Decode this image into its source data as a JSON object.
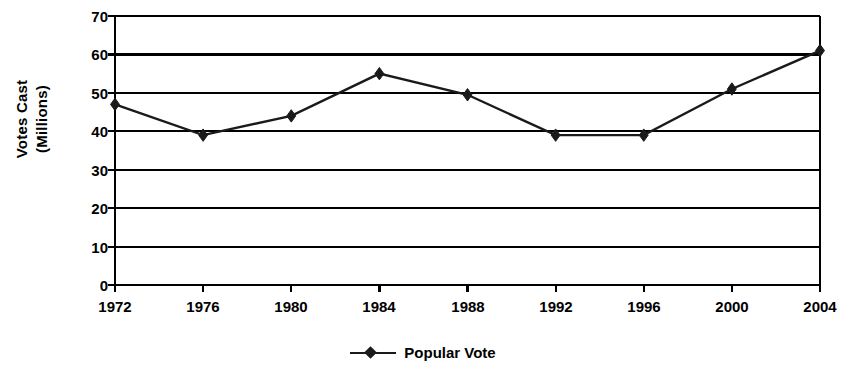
{
  "chart_data": {
    "type": "line",
    "title": "",
    "xlabel": "",
    "ylabel": "Votes Cast (Millions)",
    "ylabel_lines": [
      "Votes Cast",
      "(Millions)"
    ],
    "categories": [
      "1972",
      "1976",
      "1980",
      "1984",
      "1988",
      "1992",
      "1996",
      "2000",
      "2004"
    ],
    "x": [
      1972,
      1976,
      1980,
      1984,
      1988,
      1992,
      1996,
      2000,
      2004
    ],
    "series": [
      {
        "name": "Popular Vote",
        "values": [
          47,
          39,
          44,
          55,
          49.5,
          39,
          39,
          51,
          61
        ],
        "marker": "diamond",
        "color": "#1a1a1a"
      }
    ],
    "ylim": [
      0,
      70
    ],
    "y_ticks": [
      0,
      10,
      20,
      30,
      40,
      50,
      60,
      70
    ],
    "y_tick_labels": [
      "0",
      "10",
      "20",
      "30",
      "40",
      "50",
      "60",
      "70"
    ],
    "grid": "horizontal",
    "legend_position": "bottom-center"
  },
  "legend": {
    "entries": [
      {
        "label": "Popular Vote"
      }
    ]
  },
  "colors": {
    "series": "#1a1a1a",
    "axis": "#000000",
    "grid": "#000000",
    "background": "#ffffff"
  }
}
